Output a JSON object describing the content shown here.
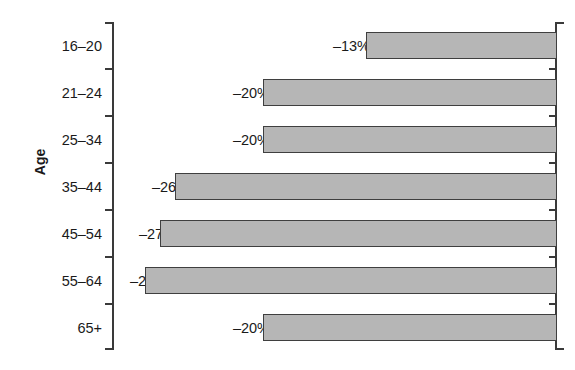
{
  "chart_data": {
    "type": "bar",
    "orientation": "horizontal",
    "title": "",
    "subtitle": "",
    "xlabel": "",
    "ylabel": "Age",
    "categories": [
      "16–20",
      "21–24",
      "25–34",
      "35–44",
      "45–54",
      "55–64",
      "65+"
    ],
    "values": [
      -13,
      -20,
      -20,
      -26,
      -27,
      -28,
      -20
    ],
    "value_labels": [
      "–13%",
      "–20%",
      "–20%",
      "–26%",
      "–27%",
      "–28%",
      "–20%"
    ],
    "unit": "%",
    "xlim": [
      -30,
      0
    ],
    "grid": false,
    "legend": null,
    "bar_fill": "#b6b6b6",
    "bar_edge": "#3f3f3f",
    "axis_color": "#3a3a3a",
    "background": "#ffffff"
  },
  "axis": {
    "y_title": "Age",
    "tick_labels": [
      "16–20",
      "21–24",
      "25–34",
      "35–44",
      "45–54",
      "55–64",
      "65+"
    ]
  },
  "bars": [
    {
      "category": "16–20",
      "label": "–13%",
      "value": -13
    },
    {
      "category": "21–24",
      "label": "–20%",
      "value": -20
    },
    {
      "category": "25–34",
      "label": "–20%",
      "value": -20
    },
    {
      "category": "35–44",
      "label": "–26%",
      "value": -26
    },
    {
      "category": "45–54",
      "label": "–27%",
      "value": -27
    },
    {
      "category": "55–64",
      "label": "–28%",
      "value": -28
    },
    {
      "category": "65+",
      "label": "–20%",
      "value": -20
    }
  ]
}
